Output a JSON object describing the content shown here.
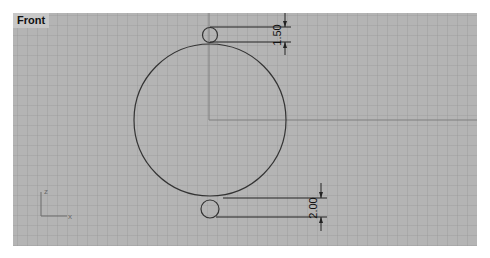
{
  "viewport": {
    "title": "Front",
    "background_color": "#b4b4b4",
    "grid_color": "#969696",
    "axis_color": "#7a7a7a",
    "curve_color": "#333333"
  },
  "axes_widget": {
    "vertical_label": "z",
    "horizontal_label": "x"
  },
  "dimensions": [
    {
      "id": "top",
      "value": "1.50"
    },
    {
      "id": "bottom",
      "value": "2.00"
    }
  ],
  "geometry": {
    "large_circle": "circle",
    "top_small_circle": "circle",
    "bottom_small_circle": "circle"
  }
}
